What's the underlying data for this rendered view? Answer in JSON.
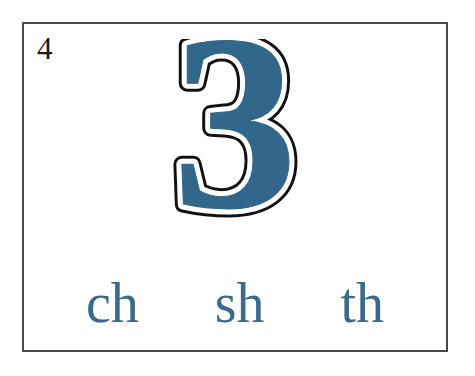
{
  "card": {
    "number_label": "4",
    "numeral": "3",
    "numeral_fill_color": "#31678a",
    "numeral_inline_color": "#ffffff",
    "numeral_outline_color": "#111111",
    "border_color": "#4a4a4a",
    "background_color": "#ffffff"
  },
  "digraphs": {
    "accent_color": "#3a6a8b",
    "items": [
      {
        "label": "ch"
      },
      {
        "label": "sh"
      },
      {
        "label": "th"
      }
    ]
  }
}
